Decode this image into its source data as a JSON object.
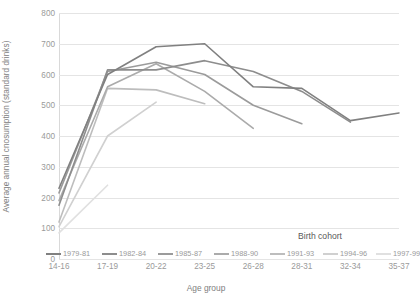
{
  "chart_data": {
    "type": "line",
    "title": "",
    "xlabel": "Age group",
    "ylabel": "Average annual cnosumption (standard drinks)",
    "categories": [
      "14-16",
      "17-19",
      "20-22",
      "23-25",
      "26-28",
      "28-31",
      "32-34",
      "35-37"
    ],
    "ylim": [
      0,
      800
    ],
    "yticks": [
      0,
      100,
      200,
      300,
      400,
      500,
      600,
      700,
      800
    ],
    "ytick_labels": [
      "0",
      "100",
      "200",
      "300",
      "400",
      "500",
      "600",
      "700",
      "800"
    ],
    "grid": true,
    "legend_title": "Birth cohort",
    "legend_position": "bottom",
    "series": [
      {
        "name": "1979-81",
        "color": "#808080",
        "values": [
          230,
          600,
          690,
          700,
          560,
          555,
          450,
          475
        ]
      },
      {
        "name": "1982-84",
        "color": "#8d8d8d",
        "values": [
          175,
          615,
          615,
          645,
          610,
          545,
          445,
          null
        ]
      },
      {
        "name": "1985-87",
        "color": "#9b9b9b",
        "values": [
          215,
          610,
          640,
          600,
          500,
          440,
          null,
          null
        ]
      },
      {
        "name": "1988-90",
        "color": "#ababab",
        "values": [
          190,
          560,
          635,
          545,
          425,
          null,
          null,
          null
        ]
      },
      {
        "name": "1991-93",
        "color": "#bdbdbd",
        "values": [
          120,
          555,
          550,
          505,
          null,
          null,
          null,
          null
        ]
      },
      {
        "name": "1994-96",
        "color": "#d0d0d0",
        "values": [
          105,
          400,
          510,
          null,
          null,
          null,
          null,
          null
        ]
      },
      {
        "name": "1997-99",
        "color": "#e0e0e0",
        "values": [
          85,
          240,
          null,
          null,
          null,
          null,
          null,
          null
        ]
      }
    ]
  }
}
